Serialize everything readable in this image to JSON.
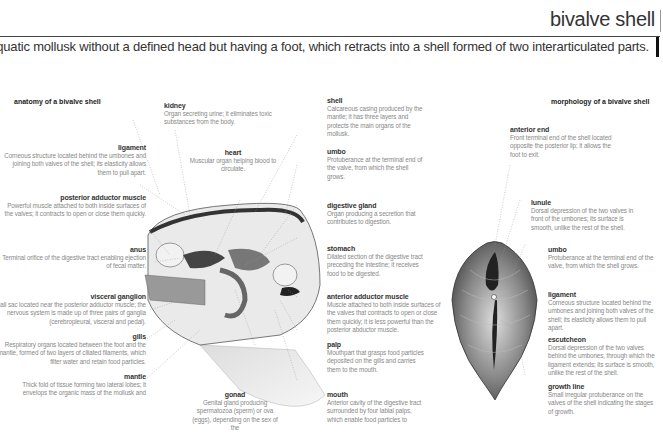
{
  "header": {
    "title": "bivalve shell",
    "subtitle": "Aquatic mollusk without a defined head but having a foot, which retracts into a shell formed of two interarticulated parts."
  },
  "anatomy": {
    "section_title": "anatomy of a bivalve shell",
    "labels": {
      "ligament": {
        "name": "ligament",
        "desc": "Corneous structure located behind the umbones and joining both valves of the shell; its elasticity allows them to pull apart."
      },
      "posterior_adductor": {
        "name": "posterior adductor muscle",
        "desc": "Powerful muscle attached to both inside surfaces of the valves; it contracts to open or close them quickly."
      },
      "anus": {
        "name": "anus",
        "desc": "Terminal orifice of the digestive tract enabling ejection of fecal matter."
      },
      "visceral_ganglion": {
        "name": "visceral ganglion",
        "desc": "Small sac located near the posterior adductor muscle; the nervous system is made up of three pairs of ganglia (cerebropleural, visceral and pedal)."
      },
      "gills": {
        "name": "gills",
        "desc": "Respiratory organs located between the foot and the mantle, formed of two layers of ciliated filaments, which filter water and retain food particles."
      },
      "mantle": {
        "name": "mantle",
        "desc": "Thick fold of tissue forming two lateral lobes; it envelops the organic mass of the mollusk and"
      },
      "kidney": {
        "name": "kidney",
        "desc": "Organ secreting urine; it eliminates toxic substances from the body."
      },
      "heart": {
        "name": "heart",
        "desc": "Muscular organ helping blood to circulate."
      },
      "gonad": {
        "name": "gonad",
        "desc": "Genital gland producing spermatozoa (sperm) or ova (eggs), depending on the sex of the"
      },
      "shell": {
        "name": "shell",
        "desc": "Calcareous casing produced by the mantle; it has three layers and protects the main organs of the mollusk."
      },
      "umbo": {
        "name": "umbo",
        "desc": "Protuberance at the terminal end of the valve, from which the shell grows."
      },
      "digestive_gland": {
        "name": "digestive gland",
        "desc": "Organ producing a secretion that contributes to digestion."
      },
      "stomach": {
        "name": "stomach",
        "desc": "Dilated section of the digestive tract preceding the intestine; it receives food to be digested."
      },
      "anterior_adductor": {
        "name": "anterior adductor muscle",
        "desc": "Muscle attached to both inside surfaces of the valves that contracts to open or close them quickly; it is less powerful than the posterior abductor muscle."
      },
      "palp": {
        "name": "palp",
        "desc": "Mouthpart that grasps food particles deposited on the gills and carries them to the mouth."
      },
      "mouth": {
        "name": "mouth",
        "desc": "Anterior cavity of the digestive tract surrounded by four labial palps, which enable food particles to"
      }
    }
  },
  "morphology": {
    "section_title": "morphology of a bivalve shell",
    "labels": {
      "anterior_end": {
        "name": "anterior end",
        "desc": "Front terminal end of the shell located opposite the posterior lip; it allows the foot to exit."
      },
      "lunule": {
        "name": "lunule",
        "desc": "Dorsal depression of the two valves in front of the umbones; its surface is smooth, unlike the rest of the shell."
      },
      "umbo": {
        "name": "umbo",
        "desc": "Protuberance at the terminal end of the valve, from which the shell grows."
      },
      "ligament": {
        "name": "ligament",
        "desc": "Corneous structure located behind the umbones and joining both valves of the shell; its elasticity allows them to pull apart."
      },
      "escutcheon": {
        "name": "escutcheon",
        "desc": "Dorsal depression of the two valves behind the umbones, through which the ligament extends; its surface is smooth, unlike the rest of the shell."
      },
      "growth_line": {
        "name": "growth line",
        "desc": "Small irregular protuberance on the valves of the shell indicating the stages of growth."
      }
    }
  }
}
